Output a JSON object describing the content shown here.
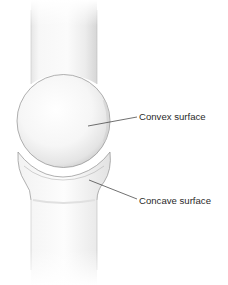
{
  "figure": {
    "labels": {
      "convex": "Convex surface",
      "concave": "Concave surface"
    },
    "colors": {
      "background": "#ffffff",
      "bone_fill": "#f4f4f4",
      "bone_shade": "#dcdcdc",
      "outline": "#9a9a9a",
      "leader_line": "#333333",
      "label_text": "#2a2a2a"
    }
  }
}
